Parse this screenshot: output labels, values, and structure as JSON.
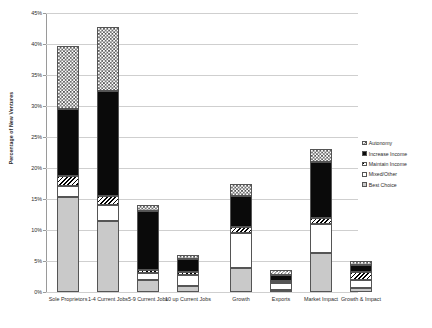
{
  "chart_data": {
    "type": "bar",
    "subtype": "stacked-bar",
    "title": "",
    "xlabel": "",
    "ylabel": "Percentage of New Ventures",
    "ylim": [
      0,
      45
    ],
    "ytick_values": [
      0,
      5,
      10,
      15,
      20,
      25,
      30,
      35,
      40,
      45
    ],
    "ytick_labels": [
      "0%",
      "5%",
      "10%",
      "15%",
      "20%",
      "25%",
      "30%",
      "35%",
      "40%",
      "45%"
    ],
    "grid": true,
    "legend_position": "right",
    "categories": [
      "Sole Proprietors",
      "1-4 Current Jobs",
      "5-9 Current Jobs",
      "10 up Current Jobs",
      "Growth",
      "Exports",
      "Market Impact",
      "Growth & Impact"
    ],
    "series": [
      {
        "name": "Best Choice",
        "pattern": "solid-gray",
        "values": [
          15.3,
          11.5,
          2.0,
          1.0,
          3.8,
          0.4,
          6.3,
          0.6
        ]
      },
      {
        "name": "Mixed/Other",
        "pattern": "white",
        "values": [
          1.8,
          2.5,
          1.0,
          1.7,
          5.7,
          1.0,
          4.7,
          1.3
        ]
      },
      {
        "name": "Maintain Income",
        "pattern": "hatch",
        "values": [
          1.6,
          1.5,
          0.5,
          0.6,
          1.0,
          0.4,
          1.0,
          1.4
        ]
      },
      {
        "name": "Increase Income",
        "pattern": "solid-black",
        "values": [
          10.9,
          17.0,
          9.5,
          2.0,
          5.0,
          1.0,
          9.0,
          1.0
        ]
      },
      {
        "name": "Autonomy",
        "pattern": "checker",
        "values": [
          10.1,
          10.2,
          1.0,
          0.7,
          2.0,
          0.7,
          2.0,
          0.7
        ]
      }
    ],
    "totals": [
      39.7,
      42.7,
      14.0,
      6.0,
      17.5,
      3.5,
      23.0,
      5.0
    ]
  },
  "legend": {
    "items": [
      {
        "label": "Autonomy",
        "pattern": "checker"
      },
      {
        "label": "Increase Income",
        "pattern": "solid-black"
      },
      {
        "label": "Maintain Income",
        "pattern": "hatch"
      },
      {
        "label": "Mixed/Other",
        "pattern": "white"
      },
      {
        "label": "Best Choice",
        "pattern": "solid-gray"
      }
    ]
  }
}
